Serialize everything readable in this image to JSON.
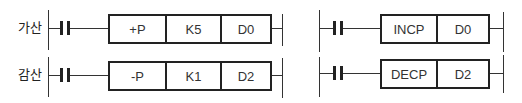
{
  "left_diagram": {
    "rungs": [
      {
        "label": "가산",
        "instruction": "+P",
        "operand1": "K5",
        "operand2": "D0"
      },
      {
        "label": "감산",
        "instruction": "-P",
        "operand1": "K1",
        "operand2": "D2"
      }
    ]
  },
  "right_diagram": {
    "rungs": [
      {
        "instruction": "INCP",
        "operand": "D0"
      },
      {
        "instruction": "DECP",
        "operand": "D2"
      }
    ]
  },
  "colors": {
    "line": "#333333",
    "background": "#ffffff"
  }
}
